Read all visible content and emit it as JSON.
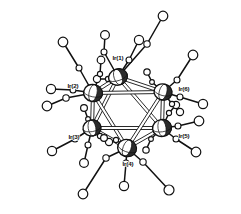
{
  "figure": {
    "kind": "molecular-structure-ortep",
    "background_color": "#ffffff",
    "line_color": "#111111",
    "metal_fill": "#2b2b2b",
    "ligand_fill": "#ffffff",
    "label_color": "#0d0d0d"
  },
  "chart_data": {
    "type": "scatter",
    "xlabel": "",
    "ylabel": "",
    "grid": false,
    "legend": "none",
    "metal_atoms": [
      {
        "label": "Ir(1)",
        "x": 118,
        "y": 77,
        "rx": 9.5,
        "ry": 8.0,
        "rot": -18,
        "label_x": 118,
        "label_y": 60,
        "label_anchor": "middle"
      },
      {
        "label": "Ir(2)",
        "x": 93,
        "y": 93,
        "rx": 9.5,
        "ry": 8.5,
        "rot": 12,
        "label_x": 73,
        "label_y": 88,
        "label_anchor": "middle"
      },
      {
        "label": "Ir(3)",
        "x": 92,
        "y": 128,
        "rx": 9.0,
        "ry": 8.0,
        "rot": -10,
        "label_x": 74,
        "label_y": 139,
        "label_anchor": "middle"
      },
      {
        "label": "Ir(4)",
        "x": 127,
        "y": 148,
        "rx": 9.5,
        "ry": 8.5,
        "rot": 20,
        "label_x": 128,
        "label_y": 166,
        "label_anchor": "middle"
      },
      {
        "label": "Ir(5)",
        "x": 162,
        "y": 128,
        "rx": 9.5,
        "ry": 8.5,
        "rot": -8,
        "label_x": 184,
        "label_y": 138,
        "label_anchor": "middle"
      },
      {
        "label": "Ir(6)",
        "x": 163,
        "y": 92,
        "rx": 9.0,
        "ry": 8.0,
        "rot": 15,
        "label_x": 184,
        "label_y": 91,
        "label_anchor": "middle"
      }
    ],
    "metal_metal_bonds": [
      {
        "from": "Ir(1)",
        "to": "Ir(2)"
      },
      {
        "from": "Ir(1)",
        "to": "Ir(6)"
      },
      {
        "from": "Ir(1)",
        "to": "Ir(3)"
      },
      {
        "from": "Ir(1)",
        "to": "Ir(5)"
      },
      {
        "from": "Ir(2)",
        "to": "Ir(3)"
      },
      {
        "from": "Ir(2)",
        "to": "Ir(4)"
      },
      {
        "from": "Ir(2)",
        "to": "Ir(6)"
      },
      {
        "from": "Ir(3)",
        "to": "Ir(4)"
      },
      {
        "from": "Ir(3)",
        "to": "Ir(5)"
      },
      {
        "from": "Ir(4)",
        "to": "Ir(5)"
      },
      {
        "from": "Ir(4)",
        "to": "Ir(6)"
      },
      {
        "from": "Ir(5)",
        "to": "Ir(6)"
      }
    ],
    "carbonyl_ligands": [
      {
        "metal": "Ir(1)",
        "c": {
          "x": 129,
          "y": 60
        },
        "o": {
          "x": 139,
          "y": 40
        },
        "c_r": 3.0,
        "o_r": 4.6
      },
      {
        "metal": "Ir(1)",
        "c": {
          "x": 147,
          "y": 44
        },
        "o": {
          "x": 163,
          "y": 16
        },
        "c_r": 3.2,
        "o_r": 4.8
      },
      {
        "metal": "Ir(1)",
        "c": {
          "x": 104,
          "y": 52
        },
        "o": {
          "x": 105,
          "y": 35
        },
        "c_r": 3.0,
        "o_r": 4.4
      },
      {
        "metal": "Ir(1)",
        "c": {
          "x": 108,
          "y": 79
        },
        "o": {
          "x": 97,
          "y": 79
        },
        "c_r": 2.6,
        "o_r": 3.6
      },
      {
        "metal": "Ir(2)",
        "c": {
          "x": 79,
          "y": 68
        },
        "o": {
          "x": 63,
          "y": 42
        },
        "c_r": 3.0,
        "o_r": 4.8
      },
      {
        "metal": "Ir(2)",
        "c": {
          "x": 66,
          "y": 98
        },
        "o": {
          "x": 47,
          "y": 106
        },
        "c_r": 3.2,
        "o_r": 4.8
      },
      {
        "metal": "Ir(2)",
        "c": {
          "x": 73,
          "y": 90
        },
        "o": {
          "x": 51,
          "y": 89
        },
        "c_r": 3.0,
        "o_r": 4.6
      },
      {
        "metal": "Ir(2)",
        "c": {
          "x": 100,
          "y": 74
        },
        "o": {
          "x": 101,
          "y": 60
        },
        "c_r": 2.6,
        "o_r": 3.8
      },
      {
        "metal": "Ir(3)",
        "c": {
          "x": 75,
          "y": 139
        },
        "o": {
          "x": 52,
          "y": 151
        },
        "c_r": 3.0,
        "o_r": 4.6
      },
      {
        "metal": "Ir(3)",
        "c": {
          "x": 88,
          "y": 145
        },
        "o": {
          "x": 84,
          "y": 163
        },
        "c_r": 3.0,
        "o_r": 4.4
      },
      {
        "metal": "Ir(3)",
        "c": {
          "x": 100,
          "y": 136
        },
        "o": {
          "x": 109,
          "y": 142
        },
        "c_r": 2.6,
        "o_r": 3.6
      },
      {
        "metal": "Ir(3)",
        "c": {
          "x": 88,
          "y": 119
        },
        "o": {
          "x": 84,
          "y": 108
        },
        "c_r": 2.4,
        "o_r": 3.4
      },
      {
        "metal": "Ir(4)",
        "c": {
          "x": 106,
          "y": 158
        },
        "o": {
          "x": 83,
          "y": 194
        },
        "c_r": 3.2,
        "o_r": 4.8
      },
      {
        "metal": "Ir(4)",
        "c": {
          "x": 143,
          "y": 162
        },
        "o": {
          "x": 169,
          "y": 190
        },
        "c_r": 3.2,
        "o_r": 5.0
      },
      {
        "metal": "Ir(4)",
        "c": {
          "x": 126,
          "y": 163
        },
        "o": {
          "x": 124,
          "y": 186
        },
        "c_r": 3.0,
        "o_r": 4.6
      },
      {
        "metal": "Ir(4)",
        "c": {
          "x": 116,
          "y": 140
        },
        "o": {
          "x": 104,
          "y": 138
        },
        "c_r": 2.6,
        "o_r": 3.4
      },
      {
        "metal": "Ir(5)",
        "c": {
          "x": 176,
          "y": 139
        },
        "o": {
          "x": 196,
          "y": 152
        },
        "c_r": 3.0,
        "o_r": 4.8
      },
      {
        "metal": "Ir(5)",
        "c": {
          "x": 178,
          "y": 126
        },
        "o": {
          "x": 199,
          "y": 121
        },
        "c_r": 3.0,
        "o_r": 4.8
      },
      {
        "metal": "Ir(5)",
        "c": {
          "x": 169,
          "y": 113
        },
        "o": {
          "x": 176,
          "y": 105
        },
        "c_r": 2.6,
        "o_r": 3.6
      },
      {
        "metal": "Ir(5)",
        "c": {
          "x": 151,
          "y": 139
        },
        "o": {
          "x": 146,
          "y": 150
        },
        "c_r": 2.4,
        "o_r": 3.2
      },
      {
        "metal": "Ir(6)",
        "c": {
          "x": 177,
          "y": 80
        },
        "o": {
          "x": 193,
          "y": 55
        },
        "c_r": 3.0,
        "o_r": 4.8
      },
      {
        "metal": "Ir(6)",
        "c": {
          "x": 180,
          "y": 97
        },
        "o": {
          "x": 203,
          "y": 104
        },
        "c_r": 3.0,
        "o_r": 4.6
      },
      {
        "metal": "Ir(6)",
        "c": {
          "x": 172,
          "y": 104
        },
        "o": {
          "x": 180,
          "y": 112
        },
        "c_r": 2.6,
        "o_r": 3.6
      },
      {
        "metal": "Ir(6)",
        "c": {
          "x": 152,
          "y": 82
        },
        "o": {
          "x": 147,
          "y": 72
        },
        "c_r": 2.4,
        "o_r": 3.2
      }
    ],
    "long_ligand_arms": [
      {
        "from": {
          "x": 147,
          "y": 44
        },
        "to": {
          "x": 118,
          "y": 77
        }
      },
      {
        "from": {
          "x": 129,
          "y": 60
        },
        "to": {
          "x": 118,
          "y": 77
        }
      }
    ],
    "counts": {
      "metal_atoms": 6,
      "metal_metal_bonds": 12,
      "carbonyl_ligands": 24
    }
  }
}
